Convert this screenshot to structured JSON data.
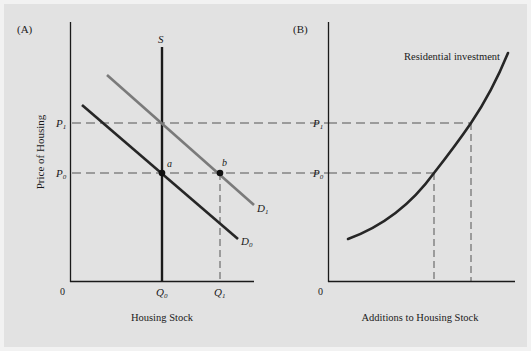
{
  "panels": [
    {
      "id": "A",
      "label": "(A)",
      "y_axis_label": "Price of Housing",
      "x_axis_label": "Housing Stock",
      "origin_label": "0",
      "supply_label": "S",
      "price_ticks": [
        {
          "name": "P",
          "sub": "1"
        },
        {
          "name": "P",
          "sub": "0"
        }
      ],
      "quantity_ticks": [
        {
          "name": "Q",
          "sub": "0"
        },
        {
          "name": "Q",
          "sub": "1"
        }
      ],
      "demand_curves": [
        {
          "name": "D",
          "sub": "1"
        },
        {
          "name": "D",
          "sub": "0"
        }
      ],
      "points": [
        {
          "label": "a"
        },
        {
          "label": "b"
        }
      ]
    },
    {
      "id": "B",
      "label": "(B)",
      "x_axis_label": "Additions to Housing Stock",
      "origin_label": "0",
      "curve_label": "Residential investment",
      "price_ticks": [
        {
          "name": "P",
          "sub": "1"
        },
        {
          "name": "P",
          "sub": "0"
        }
      ]
    }
  ],
  "colors": {
    "background": "#e2e2e2",
    "axis": "#1a1a1a",
    "d0": "#262626",
    "d1": "#7a7a7a",
    "dashed": "#444444"
  }
}
